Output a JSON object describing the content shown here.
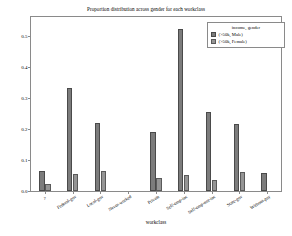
{
  "chart_data": {
    "type": "bar",
    "title": "Proportion distribution across gender for each workclass",
    "xlabel": "workclass",
    "ylabel": "",
    "ylim": [
      0.0,
      0.56
    ],
    "yticks": [
      "0.0",
      "0.1",
      "0.2",
      "0.3",
      "0.4",
      "0.5"
    ],
    "ytick_values": [
      0.0,
      0.1,
      0.2,
      0.3,
      0.4,
      0.5
    ],
    "grid": false,
    "legend_position": "upper right",
    "legend_title": "income,  gender",
    "categories": [
      "?",
      "Federal-gov",
      "Local-gov",
      "Never-worked",
      "Private",
      "Self-emp-inc",
      "Self-emp-not-inc",
      "State-gov",
      "Without-pay"
    ],
    "series": [
      {
        "name": "(>50k,  Male)",
        "color": "#7c7c7c",
        "values": [
          0.065,
          0.33,
          0.22,
          0.0,
          0.19,
          0.52,
          0.255,
          0.215,
          0.057
        ]
      },
      {
        "name": "(>50k,  Female)",
        "color": "#959595",
        "values": [
          0.023,
          0.055,
          0.065,
          0.0,
          0.043,
          0.052,
          0.037,
          0.06,
          0.0
        ]
      }
    ]
  },
  "figure": {
    "background_color": "#ffffff",
    "axes_color": "#8a8a8a"
  }
}
